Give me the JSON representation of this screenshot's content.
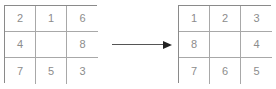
{
  "diagram": {
    "colors": {
      "outer_border": "#8a8a8a",
      "inner_line": "#a8a8a8",
      "digit": "#8c8c8c",
      "arrow_shaft": "#555555",
      "arrow_head": "#222222",
      "background": "#ffffff"
    },
    "grids": [
      {
        "name": "initial-state",
        "rows": [
          [
            "2",
            "1",
            "6"
          ],
          [
            "4",
            "",
            "8"
          ],
          [
            "7",
            "5",
            "3"
          ]
        ]
      },
      {
        "name": "goal-state",
        "rows": [
          [
            "1",
            "2",
            "3"
          ],
          [
            "8",
            "",
            "4"
          ],
          [
            "7",
            "6",
            "5"
          ]
        ]
      }
    ],
    "arrow": {
      "name": "transition-arrow",
      "direction": "right",
      "glyph": "→"
    }
  }
}
